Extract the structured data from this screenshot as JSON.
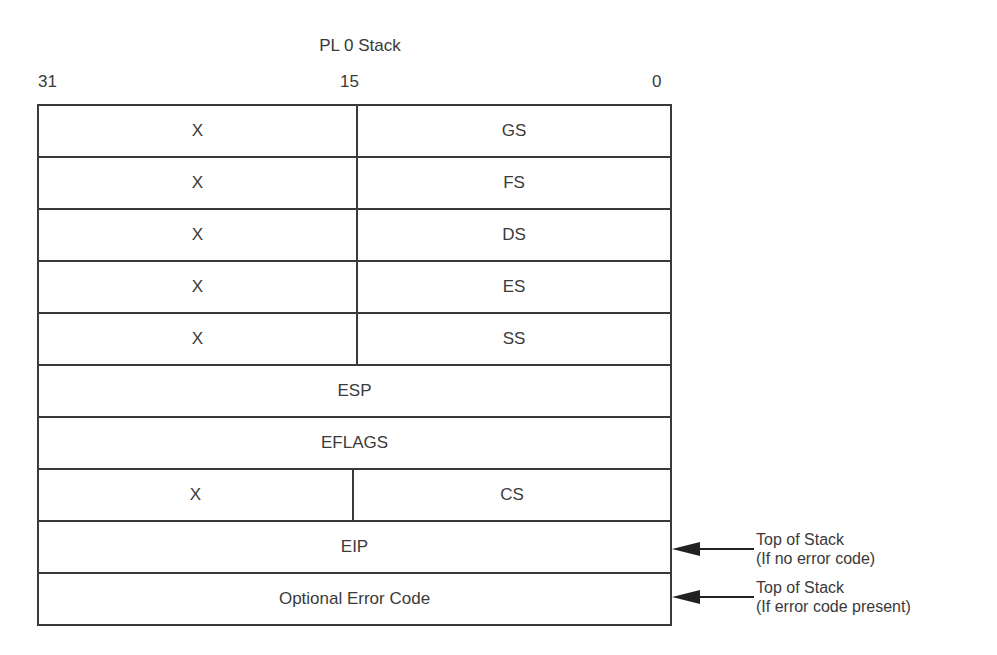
{
  "diagram": {
    "title": "PL 0 Stack",
    "bit_labels": {
      "left": "31",
      "middle": "15",
      "right": "0"
    },
    "rows": [
      {
        "type": "split",
        "upper": "X",
        "lower": "GS"
      },
      {
        "type": "split",
        "upper": "X",
        "lower": "FS"
      },
      {
        "type": "split",
        "upper": "X",
        "lower": "DS"
      },
      {
        "type": "split",
        "upper": "X",
        "lower": "ES"
      },
      {
        "type": "split",
        "upper": "X",
        "lower": "SS"
      },
      {
        "type": "full",
        "label": "ESP"
      },
      {
        "type": "full",
        "label": "EFLAGS"
      },
      {
        "type": "split",
        "upper": "X",
        "lower": "CS"
      },
      {
        "type": "full",
        "label": "EIP"
      },
      {
        "type": "full",
        "label": "Optional Error Code"
      }
    ],
    "annotations": [
      {
        "points_to": "EIP",
        "line1": "Top of Stack",
        "line2": "(If no error code)"
      },
      {
        "points_to": "Optional Error Code",
        "line1": "Top of Stack",
        "line2": "(If error code present)"
      }
    ],
    "line_color": "#3a3a3a"
  }
}
